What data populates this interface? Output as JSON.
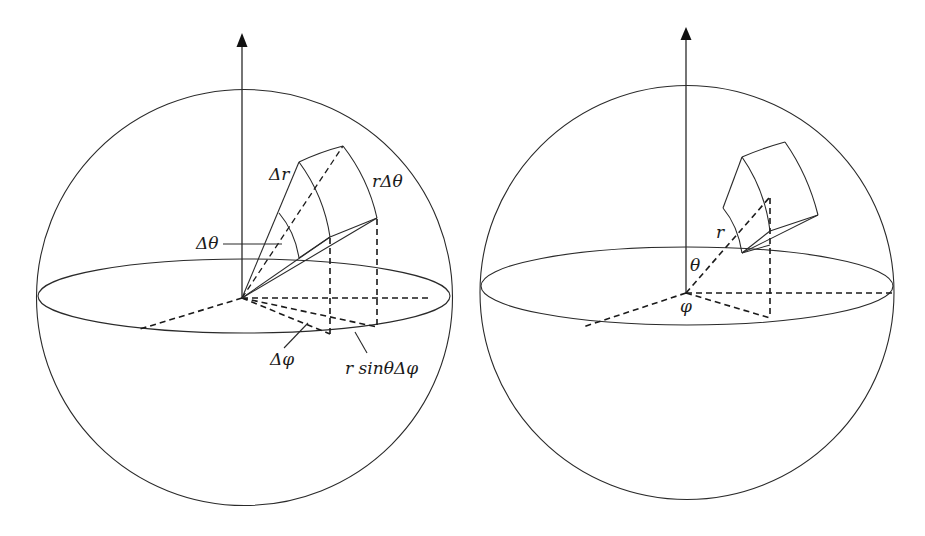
{
  "figure": {
    "panels": [
      {
        "id": "left",
        "title": "Volume element with increments",
        "labels": {
          "delta_r": "Δr",
          "r_delta_theta": "rΔθ",
          "delta_theta": "Δθ",
          "delta_phi": "Δφ",
          "r_sin_theta_delta_phi": "r sinθΔφ"
        }
      },
      {
        "id": "right",
        "title": "Position in spherical coordinates",
        "labels": {
          "r": "r",
          "theta": "θ",
          "phi": "φ"
        }
      }
    ],
    "colors": {
      "line": "#2a2a2a",
      "background": "#ffffff"
    }
  }
}
